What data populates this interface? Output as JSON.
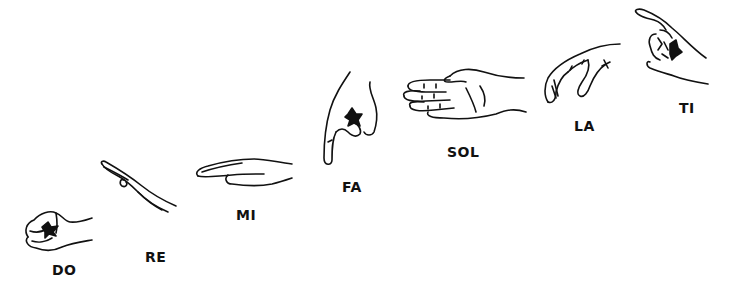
{
  "diagram": {
    "title": "",
    "steps": [
      {
        "syllable": "DO",
        "icon": "closed-fist-hand-sign"
      },
      {
        "syllable": "RE",
        "icon": "flat-hand-angled-up-sign"
      },
      {
        "syllable": "MI",
        "icon": "flat-hand-horizontal-sign"
      },
      {
        "syllable": "FA",
        "icon": "thumb-pointing-down-sign"
      },
      {
        "syllable": "SOL",
        "icon": "open-palm-facing-in-sign"
      },
      {
        "syllable": "LA",
        "icon": "relaxed-hand-drooping-sign"
      },
      {
        "syllable": "TI",
        "icon": "index-finger-pointing-up-sign"
      }
    ],
    "line_color": "#111111",
    "background": "#ffffff"
  }
}
